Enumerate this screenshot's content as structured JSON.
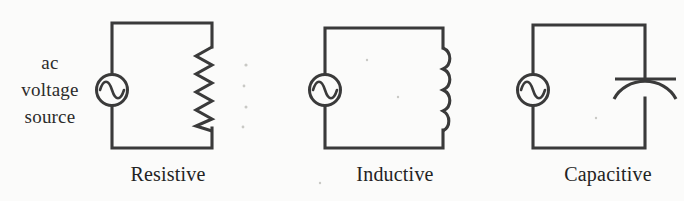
{
  "figure": {
    "background_color": "#fbfbfa",
    "ink_color": "#3a3a3a",
    "width": 684,
    "height": 201
  },
  "source_label": {
    "line1": "ac",
    "line2": "voltage",
    "line3": "source",
    "full_text": "ac voltage source"
  },
  "circuits": [
    {
      "caption": "Resistive",
      "component": "resistor",
      "component_icon": "resistor-zigzag-icon",
      "source_icon": "ac-source-icon",
      "zigzag_peaks": 6
    },
    {
      "caption": "Inductive",
      "component": "inductor",
      "component_icon": "inductor-coil-icon",
      "source_icon": "ac-source-icon",
      "coil_loops": 4
    },
    {
      "caption": "Capacitive",
      "component": "capacitor",
      "component_icon": "capacitor-curved-plate-icon",
      "source_icon": "ac-source-icon",
      "plates": 2
    }
  ]
}
